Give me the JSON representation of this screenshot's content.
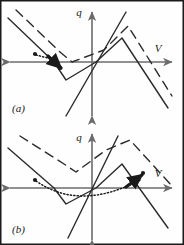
{
  "figure": {
    "width": 184,
    "height": 245,
    "background_color": "#fefefe",
    "border_color": "#1a1a1a",
    "ink_color": "#2b2b2b",
    "axis_color": "#6b6b6b",
    "panels": [
      {
        "id": "panel-a",
        "label": "(a)",
        "label_x": 12,
        "label_y": 112,
        "axis_label_x": "V",
        "axis_label_y": "q",
        "axis_label_x_pos": {
          "x": 158,
          "y": 52
        },
        "axis_label_y_pos": {
          "x": 79,
          "y": 16
        }
      },
      {
        "id": "panel-b",
        "label": "(b)",
        "label_x": 12,
        "label_y": 233,
        "axis_label_x": "V",
        "axis_label_y": "q",
        "axis_label_x_pos": {
          "x": 158,
          "y": 177
        },
        "axis_label_y_pos": {
          "x": 79,
          "y": 141
        }
      }
    ]
  },
  "chart_data": {
    "type": "line",
    "title": "",
    "xlabel": "V",
    "ylabel": "q",
    "grid": false,
    "legend": null,
    "panels": [
      {
        "id": "panel-a",
        "axes": {
          "x_axis_y": 62,
          "y_axis_x": 92,
          "x_range": [
            10,
            172
          ],
          "y_range": [
            12,
            116
          ],
          "x_arrows": "both",
          "y_arrows": "both"
        },
        "series": [
          {
            "name": "solid-branch",
            "style": "solid",
            "points": [
              [
                8,
                18
              ],
              [
                54,
                62
              ],
              [
                66,
                80
              ],
              [
                96,
                62
              ],
              [
                122,
                38
              ],
              [
                168,
                108
              ]
            ]
          },
          {
            "name": "dashed-branch",
            "style": "dashed",
            "points": [
              [
                16,
                10
              ],
              [
                60,
                52
              ],
              [
                72,
                62
              ],
              [
                104,
                50
              ],
              [
                128,
                26
              ],
              [
                172,
                96
              ]
            ]
          },
          {
            "name": "load-line",
            "style": "solid",
            "points": [
              [
                66,
                116
              ],
              [
                126,
                12
              ]
            ]
          },
          {
            "name": "trajectory",
            "style": "dotted",
            "points": [
              [
                36,
                55
              ],
              [
                48,
                58
              ],
              [
                58,
                64
              ]
            ]
          }
        ],
        "markers": [
          {
            "name": "operating-point-start",
            "x": 35,
            "y": 54
          },
          {
            "name": "operating-point-end",
            "x": 60,
            "y": 68
          }
        ],
        "arrows": [
          {
            "name": "trajectory-arrow",
            "from": [
              48,
              56
            ],
            "to": [
              61,
              68
            ]
          }
        ]
      },
      {
        "id": "panel-b",
        "axes": {
          "x_axis_y": 188,
          "y_axis_x": 92,
          "x_range": [
            10,
            172
          ],
          "y_range": [
            134,
            240
          ],
          "x_arrows": "both",
          "y_arrows": "both"
        },
        "series": [
          {
            "name": "solid-branch",
            "style": "solid",
            "points": [
              [
                8,
                148
              ],
              [
                54,
                188
              ],
              [
                66,
                204
              ],
              [
                96,
                188
              ],
              [
                122,
                164
              ],
              [
                168,
                228
              ]
            ]
          },
          {
            "name": "dashed-branch",
            "style": "dashed",
            "points": [
              [
                20,
                136
              ],
              [
                64,
                164
              ],
              [
                76,
                172
              ],
              [
                106,
                150
              ],
              [
                130,
                140
              ],
              [
                172,
                186
              ]
            ]
          },
          {
            "name": "load-line",
            "style": "solid",
            "points": [
              [
                68,
                238
              ],
              [
                118,
                136
              ]
            ]
          },
          {
            "name": "trajectory",
            "style": "dotted",
            "points": [
              [
                36,
                181
              ],
              [
                58,
                190
              ],
              [
                80,
                196
              ],
              [
                100,
                196
              ],
              [
                122,
                190
              ],
              [
                140,
                180
              ]
            ]
          }
        ],
        "markers": [
          {
            "name": "operating-point-start",
            "x": 35,
            "y": 180
          },
          {
            "name": "operating-point-end",
            "x": 143,
            "y": 173
          }
        ],
        "arrows": [
          {
            "name": "trajectory-arrow",
            "from": [
              126,
              187
            ],
            "to": [
              142,
              175
            ]
          }
        ]
      }
    ]
  }
}
